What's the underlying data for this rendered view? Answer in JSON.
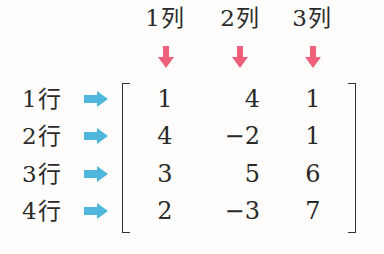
{
  "columns": [
    {
      "label": "1列",
      "arrow_icon": "down-arrow-icon"
    },
    {
      "label": "2列",
      "arrow_icon": "down-arrow-icon"
    },
    {
      "label": "3列",
      "arrow_icon": "down-arrow-icon"
    }
  ],
  "rows": [
    {
      "label": "1行",
      "arrow_icon": "right-arrow-icon",
      "values": [
        "1",
        "4",
        "1"
      ]
    },
    {
      "label": "2行",
      "arrow_icon": "right-arrow-icon",
      "values": [
        "4",
        "−2",
        "1"
      ]
    },
    {
      "label": "3行",
      "arrow_icon": "right-arrow-icon",
      "values": [
        "3",
        "5",
        "6"
      ]
    },
    {
      "label": "4行",
      "arrow_icon": "right-arrow-icon",
      "values": [
        "2",
        "−3",
        "7"
      ]
    }
  ],
  "colors": {
    "column_arrow": "#f0607a",
    "row_arrow": "#4fb6dc",
    "text": "#2a2a2a",
    "background": "#fefdfb"
  }
}
